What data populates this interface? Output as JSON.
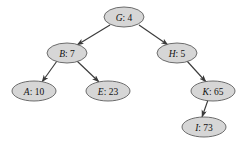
{
  "diagram": {
    "type": "binary-search-tree",
    "background_color": "#ffffff",
    "node_fill_color": "#d6d6d6",
    "node_stroke_color": "#5e5e5e",
    "edge_color": "#3b3b3b",
    "nodes": [
      {
        "id": "G",
        "key": "G",
        "value": "4",
        "label": "G: 4",
        "cx": 124,
        "cy": 17,
        "rx": 20,
        "ry": 10
      },
      {
        "id": "B",
        "key": "B",
        "value": "7",
        "label": "B: 7",
        "cx": 67,
        "cy": 53,
        "rx": 20,
        "ry": 10
      },
      {
        "id": "H",
        "key": "H",
        "value": "5",
        "label": "H: 5",
        "cx": 177,
        "cy": 53,
        "rx": 20,
        "ry": 10
      },
      {
        "id": "A",
        "key": "A",
        "value": "10",
        "label": "A: 10",
        "cx": 34,
        "cy": 91,
        "rx": 22,
        "ry": 10
      },
      {
        "id": "E",
        "key": "E",
        "value": "23",
        "label": "E: 23",
        "cx": 108,
        "cy": 91,
        "rx": 22,
        "ry": 10
      },
      {
        "id": "K",
        "key": "K",
        "value": "65",
        "label": "K: 65",
        "cx": 213,
        "cy": 91,
        "rx": 22,
        "ry": 10
      },
      {
        "id": "I",
        "key": "I",
        "value": "73",
        "label": "I: 73",
        "cx": 204,
        "cy": 127,
        "rx": 22,
        "ry": 10
      }
    ],
    "edges": [
      {
        "id": "G-B",
        "from": "G",
        "to": "B",
        "side": "left",
        "x1": 110,
        "y1": 25,
        "x2": 77,
        "y2": 45
      },
      {
        "id": "G-H",
        "from": "G",
        "to": "H",
        "side": "right",
        "x1": 139,
        "y1": 25,
        "x2": 168,
        "y2": 45
      },
      {
        "id": "B-A",
        "from": "B",
        "to": "A",
        "side": "left",
        "x1": 57,
        "y1": 61,
        "x2": 42,
        "y2": 82
      },
      {
        "id": "B-E",
        "from": "B",
        "to": "E",
        "side": "right",
        "x1": 77,
        "y1": 61,
        "x2": 99,
        "y2": 82
      },
      {
        "id": "H-K",
        "from": "H",
        "to": "K",
        "side": "right",
        "x1": 187,
        "y1": 61,
        "x2": 206,
        "y2": 82
      },
      {
        "id": "K-I",
        "from": "K",
        "to": "I",
        "side": "left",
        "x1": 208,
        "y1": 100,
        "x2": 202,
        "y2": 117
      }
    ]
  }
}
